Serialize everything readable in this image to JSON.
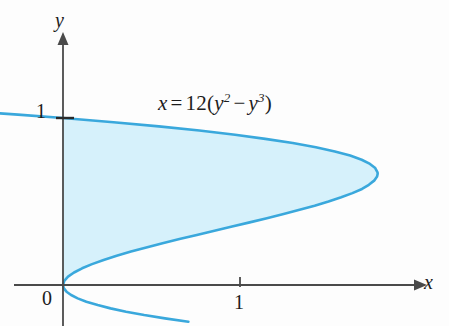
{
  "figure": {
    "title": "",
    "equation": {
      "lhs": "x",
      "equals": "=",
      "coefficient": "12",
      "open_paren": "(",
      "term1_base": "y",
      "term1_exp": "2",
      "minus": "−",
      "term2_base": "y",
      "term2_exp": "3",
      "close_paren": ")",
      "plain": "x = 12(y² − y³)"
    },
    "axes": {
      "x_label": "x",
      "y_label": "y",
      "x_ticks": [
        "1"
      ],
      "y_ticks": [
        "1"
      ],
      "origin_label": "0"
    },
    "colors": {
      "curve": "#3aa8dc",
      "fill": "#d6f1fb",
      "axis": "#4a4a4a",
      "text": "#1c1c1c",
      "background": "#fdfdfd"
    }
  },
  "chart_data": {
    "type": "line",
    "title": "",
    "xlabel": "x",
    "ylabel": "y",
    "equation": "x = 12(y^2 - y^3)",
    "orientation": "x-as-function-of-y",
    "xlim": [
      -0.25,
      2.18
    ],
    "ylim": [
      -0.25,
      1.6
    ],
    "grid": false,
    "legend": null,
    "xticks": [
      1
    ],
    "yticks": [
      1
    ],
    "xticklabels": [
      "1"
    ],
    "yticklabels": [
      "1"
    ],
    "shaded_region": {
      "description": "Region bounded by the curve x = 12(y^2 - y^3) and the y-axis for 0 <= y <= 1",
      "y_range": [
        0,
        1
      ],
      "x_left": 0,
      "x_right_expression": "12(y^2 - y^3)",
      "fill_color": "#d6f1fb"
    },
    "key_points": [
      {
        "label": "y-intercept lower",
        "x": 0,
        "y": 0
      },
      {
        "label": "y-intercept upper",
        "x": 0,
        "y": 1
      },
      {
        "label": "maximum x",
        "x": 1.7778,
        "y": 0.6667
      }
    ],
    "series": [
      {
        "name": "x = 12(y^2 - y^3)",
        "color": "#3aa8dc",
        "y": [
          -0.22,
          -0.2,
          -0.18,
          -0.16,
          -0.14,
          -0.12,
          -0.1,
          -0.08,
          -0.06,
          -0.04,
          -0.02,
          0.0,
          0.025,
          0.05,
          0.075,
          0.1,
          0.125,
          0.15,
          0.175,
          0.2,
          0.225,
          0.25,
          0.275,
          0.3,
          0.325,
          0.35,
          0.375,
          0.4,
          0.425,
          0.45,
          0.475,
          0.5,
          0.525,
          0.55,
          0.575,
          0.6,
          0.625,
          0.65,
          0.6667,
          0.675,
          0.7,
          0.725,
          0.75,
          0.775,
          0.8,
          0.825,
          0.85,
          0.875,
          0.9,
          0.925,
          0.95,
          0.975,
          1.0,
          1.02,
          1.04,
          1.06,
          1.08,
          1.1,
          1.12
        ],
        "x": [
          0.7081,
          0.576,
          0.4587,
          0.3563,
          0.2687,
          0.1959,
          0.132,
          0.0829,
          0.0458,
          0.0199,
          0.0049,
          0.0,
          0.0073,
          0.0285,
          0.0624,
          0.108,
          0.1641,
          0.2295,
          0.3032,
          0.384,
          0.4708,
          0.5625,
          0.658,
          0.756,
          0.8556,
          0.9555,
          1.0547,
          1.152,
          1.2463,
          1.3365,
          1.4216,
          1.5,
          1.5717,
          1.6352,
          1.6894,
          1.728,
          1.7578,
          1.7745,
          1.7778,
          1.7769,
          1.764,
          1.7343,
          1.6875,
          1.6223,
          1.536,
          1.4287,
          1.2983,
          1.1429,
          0.972,
          0.7702,
          0.5415,
          0.2853,
          0.0,
          -0.2546,
          -0.5196,
          -0.8034,
          -1.1059,
          -1.4289,
          -1.7725
        ]
      }
    ]
  }
}
